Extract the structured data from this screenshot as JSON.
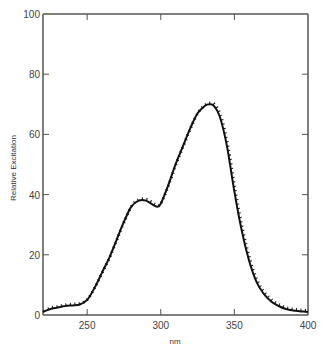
{
  "chart_data": {
    "type": "line",
    "title": "",
    "xlabel": "nm",
    "ylabel": "Relative Excitation",
    "xlim": [
      220,
      400
    ],
    "ylim": [
      0,
      100
    ],
    "x_ticks": [
      250,
      300,
      350,
      400
    ],
    "y_ticks": [
      0,
      20,
      40,
      60,
      80,
      100
    ],
    "grid": false,
    "legend": null,
    "series": [
      {
        "name": "excitation spectrum",
        "style": "solid line with dotted overlay",
        "x": [
          220,
          225,
          230,
          235,
          240,
          245,
          250,
          255,
          260,
          265,
          270,
          275,
          280,
          285,
          290,
          295,
          298,
          300,
          305,
          310,
          315,
          320,
          325,
          330,
          333,
          336,
          340,
          345,
          350,
          355,
          360,
          365,
          370,
          375,
          380,
          385,
          390,
          395,
          400
        ],
        "values": [
          1,
          2,
          2.5,
          3,
          3.2,
          3.5,
          5,
          9,
          14,
          19,
          25,
          31,
          36,
          38,
          38,
          36.5,
          36,
          37,
          43,
          50,
          56,
          62,
          67,
          69.5,
          70,
          69.5,
          66,
          56,
          41,
          28,
          18,
          11,
          7,
          4.5,
          3,
          2,
          1.5,
          1.2,
          1
        ]
      }
    ],
    "annotations": []
  },
  "axes": {
    "x_label": "nm",
    "y_label": "Relative Excitation",
    "x_tick_labels": [
      "250",
      "300",
      "350",
      "400"
    ],
    "y_tick_labels": [
      "0",
      "20",
      "40",
      "60",
      "80",
      "100"
    ]
  },
  "colors": {
    "line": "#111111",
    "axis": "#555555",
    "text": "#444444"
  }
}
